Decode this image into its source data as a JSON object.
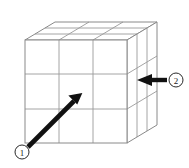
{
  "figure": {
    "background_color": "#ffffff",
    "width": 189,
    "height": 168
  },
  "cube": {
    "description": "Rubik-style 3 by 3 by 3 cube drawn in oblique projection",
    "divisions_per_edge": 3,
    "line_color": "#9a9a9a",
    "edge_color": "#8a8a8a",
    "fill_color": "#ffffff",
    "front_face": {
      "left": 25,
      "top": 40,
      "right": 127,
      "bottom": 143
    },
    "depth_offset": {
      "dx": 30,
      "dy": -18
    }
  },
  "annotations": [
    {
      "id": "arrow-1",
      "label": "1",
      "circle_label": "①",
      "direction": "up-right",
      "color": "#111111",
      "tail": {
        "x": 28,
        "y": 147
      },
      "head": {
        "x": 80,
        "y": 95
      },
      "marker": {
        "cx": 22,
        "cy": 152,
        "r": 7
      }
    },
    {
      "id": "arrow-2",
      "label": "2",
      "circle_label": "②",
      "direction": "left",
      "color": "#111111",
      "tail": {
        "x": 167,
        "y": 80
      },
      "head": {
        "x": 138,
        "y": 80
      },
      "marker": {
        "cx": 176,
        "cy": 80,
        "r": 7
      }
    }
  ]
}
